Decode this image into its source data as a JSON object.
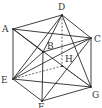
{
  "diagram": {
    "type": "cube-with-diagonals",
    "colors": {
      "line": "#2a2a2a",
      "label": "#333333",
      "background": "#ffffff"
    },
    "vertices": [
      {
        "id": "A",
        "label": "A",
        "x": 13,
        "y": 29,
        "lx": 2,
        "ly": 32
      },
      {
        "id": "B",
        "label": "B",
        "x": 43,
        "y": 52,
        "lx": 47,
        "ly": 49
      },
      {
        "id": "C",
        "label": "C",
        "x": 91,
        "y": 38,
        "lx": 94,
        "ly": 42
      },
      {
        "id": "D",
        "label": "D",
        "x": 62,
        "y": 15,
        "lx": 58,
        "ly": 10
      },
      {
        "id": "E",
        "label": "E",
        "x": 13,
        "y": 79,
        "lx": 1,
        "ly": 83
      },
      {
        "id": "F",
        "label": "F",
        "x": 42,
        "y": 101,
        "lx": 38,
        "ly": 110
      },
      {
        "id": "G",
        "label": "G",
        "x": 91,
        "y": 87,
        "lx": 92,
        "ly": 98
      },
      {
        "id": "H",
        "label": "H",
        "x": 62,
        "y": 66,
        "lx": 65,
        "ly": 62
      }
    ],
    "solid_edges": [
      [
        "A",
        "D"
      ],
      [
        "D",
        "C"
      ],
      [
        "C",
        "B"
      ],
      [
        "B",
        "A"
      ],
      [
        "A",
        "E"
      ],
      [
        "B",
        "F"
      ],
      [
        "C",
        "G"
      ],
      [
        "E",
        "F"
      ],
      [
        "F",
        "G"
      ],
      [
        "D",
        "B"
      ],
      [
        "D",
        "E"
      ],
      [
        "D",
        "G"
      ],
      [
        "E",
        "C"
      ],
      [
        "E",
        "G"
      ],
      [
        "E",
        "B"
      ],
      [
        "A",
        "C"
      ],
      [
        "A",
        "G"
      ],
      [
        "F",
        "C"
      ]
    ],
    "dashed_edges": [
      [
        "D",
        "H"
      ],
      [
        "H",
        "E"
      ],
      [
        "H",
        "G"
      ]
    ]
  }
}
